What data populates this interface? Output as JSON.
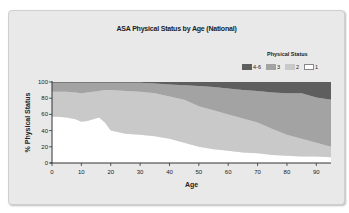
{
  "chart_data": {
    "type": "area",
    "stacked": true,
    "percent": true,
    "title": "ASA Physical Status by Age (National)",
    "xlabel": "Age",
    "ylabel": "% Physical Status",
    "xlim": [
      0,
      95
    ],
    "ylim": [
      0,
      100
    ],
    "x_ticks": [
      "0",
      "10",
      "20",
      "30",
      "40",
      "50",
      "60",
      "70",
      "80",
      "90"
    ],
    "y_ticks": [
      "0",
      "20",
      "40",
      "60",
      "80",
      "100"
    ],
    "grid": false,
    "legend_title": "Physical Status",
    "legend_position": "top-right",
    "x": [
      0,
      2,
      5,
      8,
      10,
      12,
      16,
      18,
      20,
      25,
      30,
      35,
      40,
      45,
      50,
      55,
      60,
      65,
      70,
      75,
      80,
      85,
      90,
      95
    ],
    "series": [
      {
        "name": "1",
        "color": "#ffffff",
        "values": [
          57,
          57,
          56,
          54,
          51,
          52,
          56,
          50,
          40,
          36,
          35,
          33,
          30,
          25,
          20,
          17,
          15,
          13,
          12,
          10,
          9,
          8,
          8,
          7
        ]
      },
      {
        "name": "2",
        "color": "#c9c9c9",
        "values": [
          31,
          31,
          32,
          33,
          35,
          35,
          33,
          40,
          50,
          53,
          53,
          53,
          52,
          53,
          50,
          48,
          45,
          42,
          38,
          32,
          26,
          22,
          17,
          13
        ]
      },
      {
        "name": "3",
        "color": "#a3a3a3",
        "values": [
          11,
          11,
          11,
          12,
          13,
          12,
          10,
          9,
          9,
          10,
          11,
          12,
          15,
          18,
          25,
          29,
          32,
          35,
          39,
          45,
          51,
          56,
          56,
          58
        ]
      },
      {
        "name": "4-6",
        "color": "#5e5e5e",
        "values": [
          1,
          1,
          1,
          1,
          1,
          1,
          1,
          1,
          1,
          1,
          1,
          2,
          3,
          4,
          5,
          6,
          8,
          10,
          11,
          13,
          14,
          14,
          19,
          22
        ]
      }
    ]
  },
  "legend": {
    "title": "Physical Status",
    "items": [
      {
        "label": "4-6",
        "color": "#5e5e5e"
      },
      {
        "label": "3",
        "color": "#a3a3a3"
      },
      {
        "label": "2",
        "color": "#c9c9c9"
      },
      {
        "label": "1",
        "color": "#ffffff"
      }
    ]
  }
}
